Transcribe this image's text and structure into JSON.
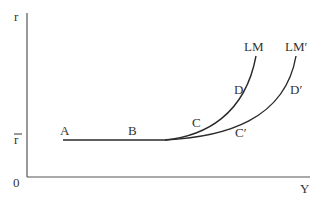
{
  "diagram": {
    "type": "IS-LM liquidity trap diagram",
    "axes": {
      "y_label": "r",
      "x_label": "Y",
      "origin_label": "0",
      "rbar_label": "r"
    },
    "curves": [
      {
        "name": "LM",
        "label": "LM"
      },
      {
        "name": "LM-prime",
        "label": "LM′"
      }
    ],
    "points": {
      "A": "A",
      "B": "B",
      "C": "C",
      "C_prime": "C′",
      "D": "D",
      "D_prime": "D′"
    },
    "colors": {
      "axis": "#555555",
      "curve": "#2a2a2a",
      "text": "#333333",
      "background": "#ffffff"
    }
  }
}
